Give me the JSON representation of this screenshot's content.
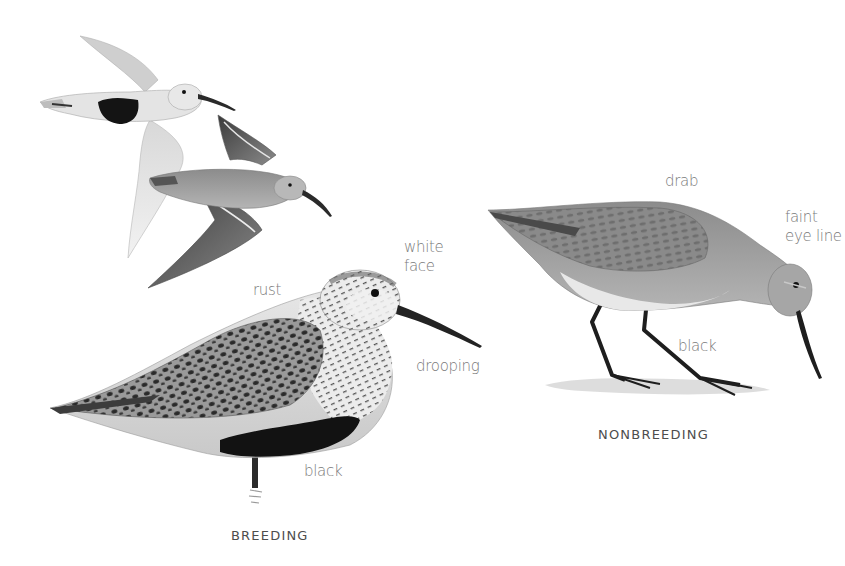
{
  "plate": {
    "subject": "Dunlin",
    "figures": [
      {
        "id": "flight-breeding",
        "description": "breeding adult in flight, black belly patch"
      },
      {
        "id": "flight-nonbreeding",
        "description": "nonbreeding adult in flight, dark wings with white wing stripe"
      },
      {
        "id": "standing-breeding",
        "description": "breeding adult standing"
      },
      {
        "id": "standing-nonbreeding",
        "description": "nonbreeding adult foraging"
      }
    ]
  },
  "labels": {
    "rust": "rust",
    "white_face": "white\nface",
    "drooping": "drooping",
    "black_breeding": "black",
    "drab": "drab",
    "faint_eye_line": "faint\neye line",
    "black_nonbreeding": "black"
  },
  "captions": {
    "breeding": "BREEDING",
    "nonbreeding": "NONBREEDING"
  },
  "colors": {
    "label_text": "#7a7a7a",
    "caption_text": "#4d4d4d",
    "background": "#ffffff"
  }
}
